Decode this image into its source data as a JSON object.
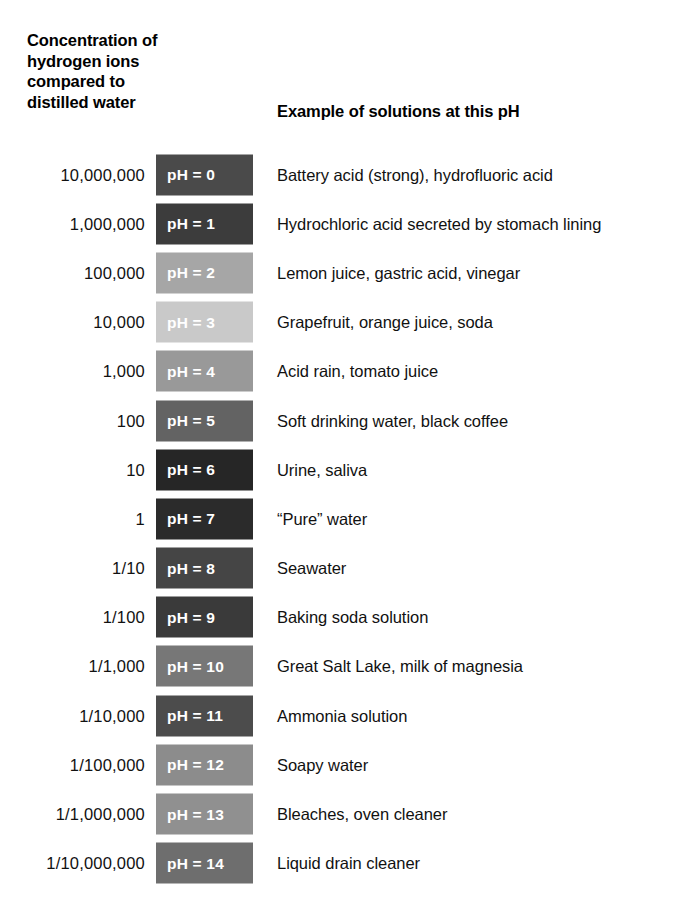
{
  "header": {
    "left_title_lines": [
      "Concentration of",
      "hydrogen ions",
      "compared to",
      "distilled water"
    ],
    "right_title": "Example of solutions at this pH"
  },
  "columns": {
    "concentration_header": "Concentration of hydrogen ions compared to distilled water",
    "ph_header": "",
    "example_header": "Example of solutions at this pH"
  },
  "chart_data": {
    "type": "table",
    "columns": [
      "Concentration of hydrogen ions compared to distilled water",
      "pH",
      "Example of solutions at this pH"
    ],
    "rows": [
      {
        "concentration": "10,000,000",
        "ph_value": 0,
        "ph_label": "pH = 0",
        "example": "Battery acid (strong), hydrofluoric acid",
        "chip_color": "#4a4a4a"
      },
      {
        "concentration": "1,000,000",
        "ph_value": 1,
        "ph_label": "pH = 1",
        "example": "Hydrochloric acid secreted by stomach lining",
        "chip_color": "#3c3c3c"
      },
      {
        "concentration": "100,000",
        "ph_value": 2,
        "ph_label": "pH = 2",
        "example": "Lemon juice, gastric acid, vinegar",
        "chip_color": "#a6a6a6"
      },
      {
        "concentration": "10,000",
        "ph_value": 3,
        "ph_label": "pH = 3",
        "example": "Grapefruit, orange juice, soda",
        "chip_color": "#c9c9c9"
      },
      {
        "concentration": "1,000",
        "ph_value": 4,
        "ph_label": "pH = 4",
        "example": "Acid rain, tomato juice",
        "chip_color": "#999999"
      },
      {
        "concentration": "100",
        "ph_value": 5,
        "ph_label": "pH = 5",
        "example": "Soft drinking water, black coffee",
        "chip_color": "#636363"
      },
      {
        "concentration": "10",
        "ph_value": 6,
        "ph_label": "pH = 6",
        "example": "Urine, saliva",
        "chip_color": "#262626"
      },
      {
        "concentration": "1",
        "ph_value": 7,
        "ph_label": "pH = 7",
        "example": "“Pure” water",
        "chip_color": "#2b2b2b"
      },
      {
        "concentration": "1/10",
        "ph_value": 8,
        "ph_label": "pH = 8",
        "example": "Seawater",
        "chip_color": "#454545"
      },
      {
        "concentration": "1/100",
        "ph_value": 9,
        "ph_label": "pH = 9",
        "example": "Baking soda solution",
        "chip_color": "#3a3a3a"
      },
      {
        "concentration": "1/1,000",
        "ph_value": 10,
        "ph_label": "pH = 10",
        "example": "Great Salt Lake, milk of magnesia",
        "chip_color": "#777777"
      },
      {
        "concentration": "1/10,000",
        "ph_value": 11,
        "ph_label": "pH = 11",
        "example": "Ammonia solution",
        "chip_color": "#4c4c4c"
      },
      {
        "concentration": "1/100,000",
        "ph_value": 12,
        "ph_label": "pH = 12",
        "example": "Soapy water",
        "chip_color": "#8c8c8c"
      },
      {
        "concentration": "1/1,000,000",
        "ph_value": 13,
        "ph_label": "pH = 13",
        "example": "Bleaches, oven cleaner",
        "chip_color": "#909090"
      },
      {
        "concentration": "1/10,000,000",
        "ph_value": 14,
        "ph_label": "pH = 14",
        "example": "Liquid drain cleaner",
        "chip_color": "#6e6e6e"
      }
    ]
  },
  "style": {
    "background": "#ffffff",
    "text_color": "#111111",
    "chip_text_color": "#ffffff"
  }
}
